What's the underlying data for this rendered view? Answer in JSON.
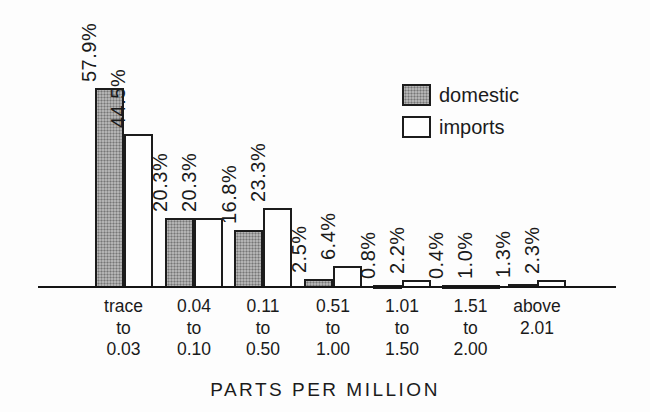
{
  "chart_data": {
    "type": "bar",
    "xlabel": "PARTS PER MILLION",
    "unit": "%",
    "grid": false,
    "y_axis_visible": false,
    "value_labels_rotated": true,
    "legend_position": "top-right",
    "categories": [
      [
        "trace",
        "to",
        "0.03"
      ],
      [
        "0.04",
        "to",
        "0.10"
      ],
      [
        "0.11",
        "to",
        "0.50"
      ],
      [
        "0.51",
        "to",
        "1.00"
      ],
      [
        "1.01",
        "to",
        "1.50"
      ],
      [
        "1.51",
        "to",
        "2.00"
      ],
      [
        "above",
        "2.01"
      ]
    ],
    "series": [
      {
        "name": "domestic",
        "pattern": "halftone",
        "color": "#b3b3b3",
        "values": [
          57.9,
          20.3,
          16.8,
          2.5,
          0.8,
          0.4,
          1.3
        ],
        "labels": [
          "57.9%",
          "20.3%",
          "16.8%",
          "2.5%",
          "0.8%",
          "0.4%",
          "1.3%"
        ]
      },
      {
        "name": "imports",
        "pattern": "solid",
        "color": "#fefefe",
        "values": [
          44.5,
          20.3,
          23.3,
          6.4,
          2.2,
          1.0,
          2.3
        ],
        "labels": [
          "44.5%",
          "20.3%",
          "23.3%",
          "6.4%",
          "2.2%",
          "1.0%",
          "2.3%"
        ]
      }
    ],
    "colors": {
      "background": "#fdfdfd",
      "axis": "#151515",
      "border": "#1c1c1c",
      "text": "#1a1a1a"
    }
  }
}
